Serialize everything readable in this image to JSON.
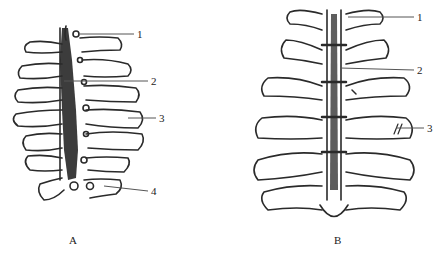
{
  "figure": {
    "panels": [
      {
        "id": "A",
        "caption": "A",
        "callouts": [
          {
            "number": "1"
          },
          {
            "number": "2"
          },
          {
            "number": "3"
          },
          {
            "number": "4"
          }
        ]
      },
      {
        "id": "B",
        "caption": "B",
        "callouts": [
          {
            "number": "1"
          },
          {
            "number": "2"
          },
          {
            "number": "3"
          }
        ]
      }
    ],
    "colors": {
      "line": "#2a2a2a",
      "fill_dark": "#1a1a1a",
      "background": "#ffffff",
      "leader": "#555555"
    }
  }
}
